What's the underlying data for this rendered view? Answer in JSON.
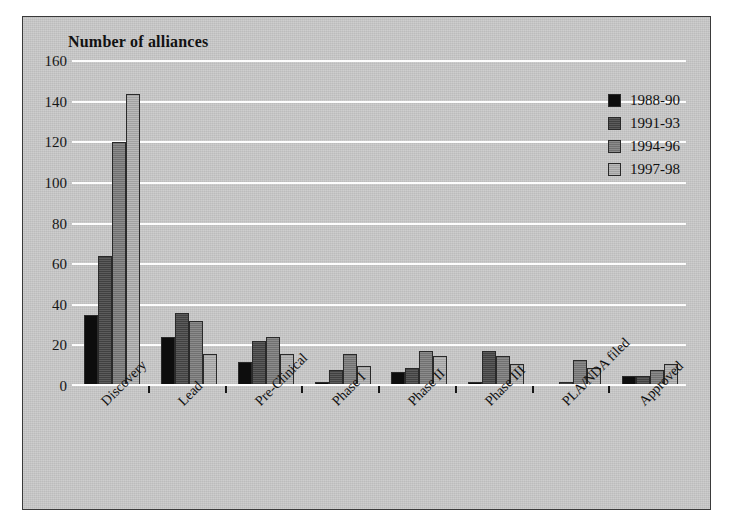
{
  "chart_data": {
    "type": "bar",
    "title": "Number of alliances",
    "xlabel": "",
    "ylabel": "Number of alliances",
    "ylim": [
      0,
      160
    ],
    "ytick_step": 20,
    "yticks": [
      160,
      140,
      120,
      100,
      80,
      60,
      40,
      20,
      0
    ],
    "grid": true,
    "legend_position": "top-right",
    "categories": [
      "Discovery",
      "Lead",
      "Pre-Clinical",
      "Phase I",
      "Phase II",
      "Phase III",
      "PLA/NDA filed",
      "Approved"
    ],
    "series": [
      {
        "name": "1988-90",
        "color": "#0d0d0d",
        "values": [
          35,
          24,
          12,
          2,
          7,
          2,
          1,
          5
        ]
      },
      {
        "name": "1991-93",
        "color": "#4a4a4a",
        "values": [
          64,
          36,
          22,
          8,
          9,
          17,
          2,
          5
        ]
      },
      {
        "name": "1994-96",
        "color": "#7e7e7e",
        "values": [
          120,
          32,
          24,
          16,
          17,
          15,
          13,
          8
        ]
      },
      {
        "name": "1997-98",
        "color": "#b0b0b0",
        "values": [
          144,
          16,
          16,
          10,
          15,
          11,
          9,
          11
        ]
      }
    ]
  },
  "figure": {
    "background_color": "#c9c9c9",
    "gridline_color": "#fdfdfd",
    "border_color": "#3a3a3a",
    "text_color": "#111111"
  }
}
